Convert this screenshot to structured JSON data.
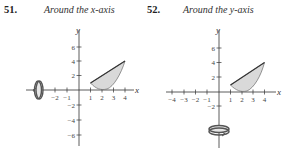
{
  "problems": [
    {
      "number": "51.",
      "caption": "Around the x-axis",
      "axis_of_rotation": "x",
      "x_ticks": [
        "−2",
        "−1",
        "1",
        "2",
        "3",
        "4"
      ],
      "y_ticks": [
        "6",
        "4",
        "2",
        "−2",
        "−4",
        "−6"
      ],
      "x_label": "x",
      "y_label": "y"
    },
    {
      "number": "52.",
      "caption": "Around the y-axis",
      "axis_of_rotation": "y",
      "x_ticks": [
        "−4",
        "−3",
        "−2",
        "−1",
        "1",
        "2",
        "3",
        "4"
      ],
      "y_ticks": [
        "6",
        "4",
        "2",
        "−2"
      ],
      "x_label": "x",
      "y_label": "y"
    }
  ],
  "colors": {
    "region_fill": "#d9d9d9",
    "line": "#333333"
  }
}
